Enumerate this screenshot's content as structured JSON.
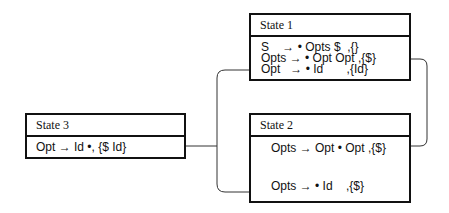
{
  "states": [
    {
      "title": "State 1",
      "items": [
        {
          "lhs": "S",
          "arrow": "→",
          "rhs": "• Opts $",
          "lookahead": ",{}"
        },
        {
          "lhs": "Opts",
          "arrow": "→",
          "rhs": "• Opt Opt",
          "lookahead": ",{$}"
        },
        {
          "lhs": "Opt",
          "arrow": "→",
          "rhs": "• Id",
          "lookahead": ",{Id}"
        }
      ]
    },
    {
      "title": "State 2",
      "items": [
        {
          "lhs": "Opts",
          "arrow": "→",
          "rhs": "Opt • Opt",
          "lookahead": ",{$}"
        },
        {
          "lhs": "Opts",
          "arrow": "→",
          "rhs": "• Id",
          "lookahead": ",{$}"
        }
      ]
    },
    {
      "title": "State 3",
      "items": [
        {
          "text": "Opt → Id •, {$ Id}"
        }
      ]
    }
  ],
  "colors": {
    "line": "#111111",
    "connector": "#333333",
    "background": "#ffffff"
  }
}
